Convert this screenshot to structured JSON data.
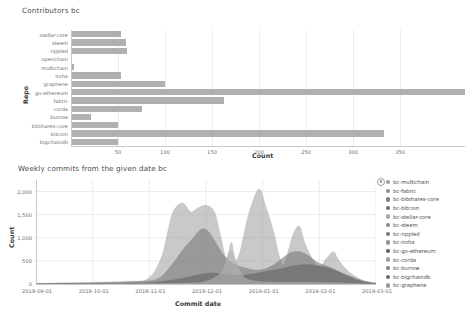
{
  "bar_chart": {
    "title": "Contributors bc",
    "ylabel": "Repo",
    "xlabel": "Count"
  },
  "area_chart": {
    "title": "Weekly commits from the given date bc",
    "ylabel": "Count",
    "xlabel": "Commit date"
  },
  "legend": {
    "handle_icon": "drag-handle-icon",
    "items": [
      {
        "label": "bc-multichain",
        "color": "#9e9e9e"
      },
      {
        "label": "bc-fabric",
        "color": "#8f8f8f"
      },
      {
        "label": "bc-bitshares-core",
        "color": "#7d7d7d"
      },
      {
        "label": "bc-bitcoin",
        "color": "#6e6e6e"
      },
      {
        "label": "bc-stellar-core",
        "color": "#a8a8a8"
      },
      {
        "label": "bc-steem",
        "color": "#888888"
      },
      {
        "label": "bc-rippled",
        "color": "#767676"
      },
      {
        "label": "bc-iroha",
        "color": "#949494"
      },
      {
        "label": "bc-go-ethereum",
        "color": "#5f5f5f"
      },
      {
        "label": "bc-corda",
        "color": "#a0a0a0"
      },
      {
        "label": "bc-burrow",
        "color": "#828282"
      },
      {
        "label": "bc-bigchaindb",
        "color": "#6a6a6a"
      },
      {
        "label": "bc-graphene",
        "color": "#9a9a9a"
      }
    ]
  },
  "chart_data": [
    {
      "type": "bar",
      "orientation": "horizontal",
      "title": "Contributors bc",
      "xlabel": "Count",
      "ylabel": "Repo",
      "xlim": [
        0,
        419
      ],
      "xticks": [
        50,
        100,
        150,
        200,
        250,
        300,
        350
      ],
      "grid": true,
      "bar_color": "#b0b0b0",
      "categories": [
        "stellar-core",
        "steem",
        "rippled",
        "openchain",
        "multichain",
        "iroha",
        "graphene",
        "go-ethereum",
        "fabric",
        "corda",
        "burrow",
        "bitshares-core",
        "bitcoin",
        "bigchaindb"
      ],
      "values": [
        53,
        58,
        60,
        1,
        3,
        53,
        100,
        419,
        163,
        75,
        21,
        50,
        333,
        50
      ]
    },
    {
      "type": "area",
      "stacked": false,
      "title": "Weekly commits from the given date bc",
      "xlabel": "Commit date",
      "ylabel": "Count",
      "ylim": [
        0,
        2250
      ],
      "yticks": [
        0,
        500,
        1000,
        1500,
        2000
      ],
      "ytick_labels": [
        "0",
        "500",
        "1,000",
        "1,500",
        "2,000"
      ],
      "xticks": [
        "2018-09-01",
        "2018-10-01",
        "2018-11-01",
        "2018-12-01",
        "2019-01-01",
        "2019-02-01",
        "2019-03-01"
      ],
      "grid": true,
      "series": [
        {
          "name": "bc-bitcoin",
          "color": "#9d9d9d",
          "peak": 2050
        },
        {
          "name": "bc-go-ethereum",
          "color": "#7a7a7a",
          "peak": 1200
        },
        {
          "name": "bc-fabric",
          "color": "#636363",
          "peak": 520
        },
        {
          "name": "bc-steem",
          "color": "#b4b4b4",
          "peak": 700
        }
      ]
    }
  ]
}
